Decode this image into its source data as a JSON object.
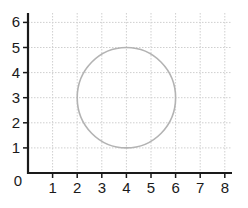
{
  "chart_data": {
    "type": "scatter",
    "title": "",
    "xlabel": "",
    "ylabel": "",
    "xlim": [
      0,
      8
    ],
    "ylim": [
      0,
      6
    ],
    "x_ticks": [
      "1",
      "2",
      "3",
      "4",
      "5",
      "6",
      "7",
      "8"
    ],
    "y_ticks": [
      "1",
      "2",
      "3",
      "4",
      "5",
      "6"
    ],
    "origin_label": "0",
    "grid": true,
    "grid_style": "dotted",
    "shapes": [
      {
        "kind": "circle",
        "center": [
          4,
          3
        ],
        "radius": 2,
        "stroke": "#b3b3b3",
        "fill": "none"
      }
    ]
  },
  "colors": {
    "axis": "#1a1a1a",
    "grid": "#cfcfcf",
    "circle": "#b3b3b3"
  }
}
